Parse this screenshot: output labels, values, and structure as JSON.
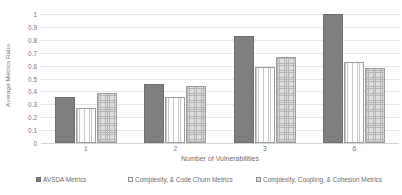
{
  "chart_data": {
    "type": "bar",
    "title": "",
    "subtitle": "",
    "xlabel": "Number of Vulnerabilities",
    "ylabel": "Average Metrics Ratio",
    "categories": [
      "1",
      "2",
      "3",
      "6"
    ],
    "series": [
      {
        "name": "AVSDA Metrics",
        "values": [
          0.36,
          0.46,
          0.83,
          1.0
        ],
        "color": "#7f7f7f",
        "pattern": "solid",
        "marker": "filled-square-swatch"
      },
      {
        "name": "Complexity, & Code Churn Metrics",
        "values": [
          0.27,
          0.36,
          0.59,
          0.63
        ],
        "color": "#fdfdfd",
        "pattern": "fine-vertical-dotted",
        "marker": "open-square-swatch"
      },
      {
        "name": "Complexity, Coupling, & Cohesion Metrics",
        "values": [
          0.39,
          0.44,
          0.67,
          0.58
        ],
        "color": "#dedede",
        "pattern": "cross-hatch-checkered",
        "marker": "hatched-square-swatch"
      }
    ],
    "ylim": [
      0,
      1
    ],
    "ytick_labels": [
      "0",
      "0.1",
      "0.2",
      "0.3",
      "0.4",
      "0.5",
      "0.6",
      "0.7",
      "0.8",
      "0.9",
      "1"
    ],
    "ytick_values": [
      0,
      0.1,
      0.2,
      0.3,
      0.4,
      0.5,
      0.6,
      0.7,
      0.8,
      0.9,
      1
    ],
    "grid": "horizontal-only",
    "grid_color": "#e6e6e6",
    "legend_position": "bottom",
    "plot_background": "#ffffff"
  }
}
